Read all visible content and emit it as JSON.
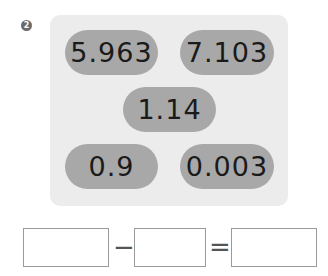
{
  "problem": {
    "number": "2"
  },
  "numbers": [
    {
      "value": "5.963"
    },
    {
      "value": "7.103"
    },
    {
      "value": "1.14"
    },
    {
      "value": "0.9"
    },
    {
      "value": "0.003"
    }
  ],
  "equation": {
    "operator": "−",
    "equals": "=",
    "boxes": [
      "",
      "",
      ""
    ]
  },
  "colors": {
    "panel": "#ececec",
    "pill": "#a8a8a8"
  }
}
